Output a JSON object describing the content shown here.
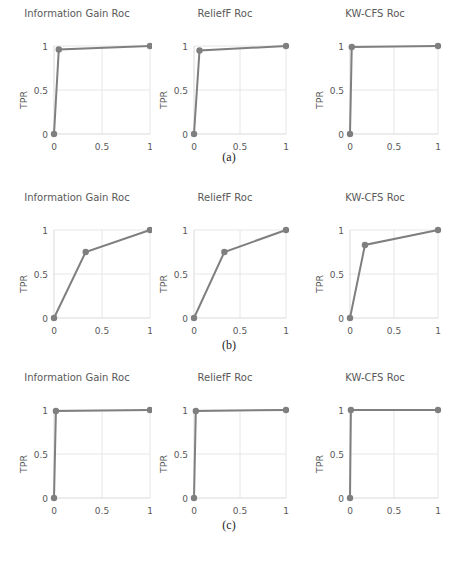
{
  "figure": {
    "row_labels": [
      "(a)",
      "(b)",
      "(c)"
    ],
    "caption": ""
  },
  "axis": {
    "xlabel": "FPR",
    "ylabel": "TPR",
    "xticks": [
      "0",
      "0.5",
      "1"
    ],
    "yticks": [
      "0",
      "0.5",
      "1"
    ]
  },
  "colors": {
    "line": "#7f7f7f",
    "marker": "#7f7f7f",
    "grid": "#e6e6e6",
    "axis": "#d9d9d9",
    "text": "#595959"
  },
  "chart_data": [
    {
      "type": "line",
      "panel": "a",
      "title": "Information Gain Roc",
      "xlabel": "FPR",
      "ylabel": "TPR",
      "xlim": [
        0,
        1
      ],
      "ylim": [
        0,
        1
      ],
      "grid": true,
      "series": [
        {
          "name": "ROC",
          "x": [
            0,
            0.05,
            1
          ],
          "y": [
            0,
            0.96,
            1
          ]
        }
      ]
    },
    {
      "type": "line",
      "panel": "a",
      "title": "ReliefF Roc",
      "xlabel": "FPR",
      "ylabel": "TPR",
      "xlim": [
        0,
        1
      ],
      "ylim": [
        0,
        1
      ],
      "grid": true,
      "series": [
        {
          "name": "ROC",
          "x": [
            0,
            0.06,
            1
          ],
          "y": [
            0,
            0.95,
            1
          ]
        }
      ]
    },
    {
      "type": "line",
      "panel": "a",
      "title": "KW-CFS Roc",
      "xlabel": "FPR",
      "ylabel": "TPR",
      "xlim": [
        0,
        1
      ],
      "ylim": [
        0,
        1
      ],
      "grid": true,
      "series": [
        {
          "name": "ROC",
          "x": [
            0,
            0.02,
            1
          ],
          "y": [
            0,
            0.99,
            1
          ]
        }
      ]
    },
    {
      "type": "line",
      "panel": "b",
      "title": "Information Gain Roc",
      "xlabel": "FPR",
      "ylabel": "TPR",
      "xlim": [
        0,
        1
      ],
      "ylim": [
        0,
        1
      ],
      "grid": true,
      "series": [
        {
          "name": "ROC",
          "x": [
            0,
            0.33,
            1
          ],
          "y": [
            0,
            0.75,
            1
          ]
        }
      ]
    },
    {
      "type": "line",
      "panel": "b",
      "title": "ReliefF Roc",
      "xlabel": "FPR",
      "ylabel": "TPR",
      "xlim": [
        0,
        1
      ],
      "ylim": [
        0,
        1
      ],
      "grid": true,
      "series": [
        {
          "name": "ROC",
          "x": [
            0,
            0.33,
            1
          ],
          "y": [
            0,
            0.75,
            1
          ]
        }
      ]
    },
    {
      "type": "line",
      "panel": "b",
      "title": "KW-CFS Roc",
      "xlabel": "FPR",
      "ylabel": "TPR",
      "xlim": [
        0,
        1
      ],
      "ylim": [
        0,
        1
      ],
      "grid": true,
      "series": [
        {
          "name": "ROC",
          "x": [
            0,
            0.17,
            1
          ],
          "y": [
            0,
            0.83,
            1
          ]
        }
      ]
    },
    {
      "type": "line",
      "panel": "c",
      "title": "Information Gain Roc",
      "xlabel": "FPR",
      "ylabel": "TPR",
      "xlim": [
        0,
        1
      ],
      "ylim": [
        0,
        1
      ],
      "grid": true,
      "series": [
        {
          "name": "ROC",
          "x": [
            0,
            0.02,
            1
          ],
          "y": [
            0,
            0.99,
            1
          ]
        }
      ]
    },
    {
      "type": "line",
      "panel": "c",
      "title": "ReliefF Roc",
      "xlabel": "FPR",
      "ylabel": "TPR",
      "xlim": [
        0,
        1
      ],
      "ylim": [
        0,
        1
      ],
      "grid": true,
      "series": [
        {
          "name": "ROC",
          "x": [
            0,
            0.02,
            1
          ],
          "y": [
            0,
            0.99,
            1
          ]
        }
      ]
    },
    {
      "type": "line",
      "panel": "c",
      "title": "KW-CFS Roc",
      "xlabel": "FPR",
      "ylabel": "TPR",
      "xlim": [
        0,
        1
      ],
      "ylim": [
        0,
        1
      ],
      "grid": true,
      "series": [
        {
          "name": "ROC",
          "x": [
            0,
            0.01,
            1
          ],
          "y": [
            0,
            1.0,
            1
          ]
        }
      ]
    }
  ]
}
